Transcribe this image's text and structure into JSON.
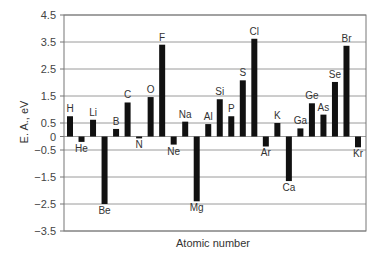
{
  "chart_data": {
    "type": "bar",
    "title": "",
    "xlabel": "Atomic number",
    "ylabel": "E. A., eV",
    "ylim": [
      -3.5,
      4.5
    ],
    "yticks": [
      4.5,
      3.5,
      2.5,
      1.5,
      0.5,
      0,
      -0.5,
      -1.5,
      -2.5,
      -3.5
    ],
    "ytick_labels": [
      "4.5",
      "3.5",
      "2.5",
      "1.5",
      "0.5",
      "0",
      "-0.5",
      "-1.5",
      "-2.5",
      "-3.5"
    ],
    "grid": true,
    "legend": null,
    "categories": [
      "H",
      "He",
      "Li",
      "Be",
      "B",
      "C",
      "N",
      "O",
      "F",
      "Ne",
      "Na",
      "Mg",
      "Al",
      "Si",
      "P",
      "S",
      "Cl",
      "Ar",
      "K",
      "Ca",
      "Ga",
      "Ge",
      "As",
      "Se",
      "Br",
      "Kr"
    ],
    "values": [
      0.75,
      -0.2,
      0.62,
      -2.5,
      0.28,
      1.26,
      -0.07,
      1.46,
      3.4,
      -0.3,
      0.55,
      -2.4,
      0.46,
      1.38,
      0.75,
      2.08,
      3.62,
      -0.37,
      0.5,
      -1.65,
      0.3,
      1.23,
      0.81,
      2.02,
      3.36,
      -0.4
    ],
    "bar_color": "#111111"
  }
}
